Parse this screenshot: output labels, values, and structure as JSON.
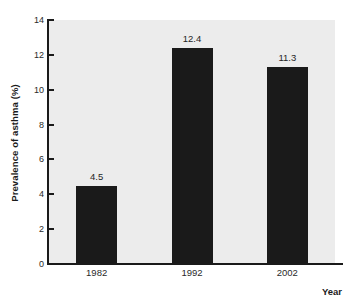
{
  "chart_data": {
    "type": "bar",
    "title": "",
    "subtitle": "",
    "xlabel": "Year",
    "ylabel": "Prevalence of asthma (%)",
    "categories": [
      "1982",
      "1992",
      "2002"
    ],
    "values": [
      4.5,
      12.4,
      11.3
    ],
    "value_labels": [
      "4.5",
      "12.4",
      "11.3"
    ],
    "ylim": [
      0,
      14
    ],
    "y_ticks": [
      0,
      2,
      4,
      6,
      8,
      10,
      12,
      14
    ],
    "y_tick_labels": [
      "0",
      "2",
      "4",
      "6",
      "8",
      "10",
      "12",
      "14"
    ],
    "grid": false,
    "legend": false,
    "legend_position": "none",
    "bar_color": "#1a1a1a",
    "plot_background": "#ececec",
    "figure_background": "#ffffff",
    "axis_color": "#1a1a1a",
    "text_color": "#2a2a2a"
  }
}
